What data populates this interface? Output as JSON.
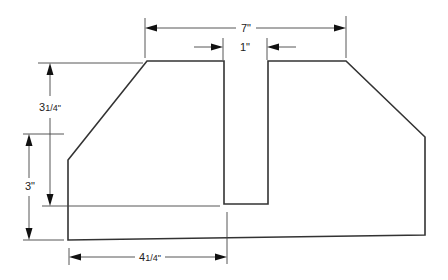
{
  "diagram": {
    "type": "technical-drawing",
    "dimensions": [
      {
        "id": "overall-top-width",
        "label": "7\"",
        "value_in": 7
      },
      {
        "id": "slot-width",
        "label": "1\"",
        "value_in": 1
      },
      {
        "id": "top-to-slot-bottom",
        "label": "3¹/4\"",
        "value_in": 3.25
      },
      {
        "id": "side-height",
        "label": "3\"",
        "value_in": 3
      },
      {
        "id": "left-to-slot",
        "label": "4¹/4\"",
        "value_in": 4.25
      }
    ],
    "labels": {
      "top_width": "7\"",
      "slot_width": "1\"",
      "upper_height": "3",
      "upper_height_frac": "1/4\"",
      "side_height": "3\"",
      "slot_offset": "4",
      "slot_offset_frac": "1/4\""
    }
  }
}
